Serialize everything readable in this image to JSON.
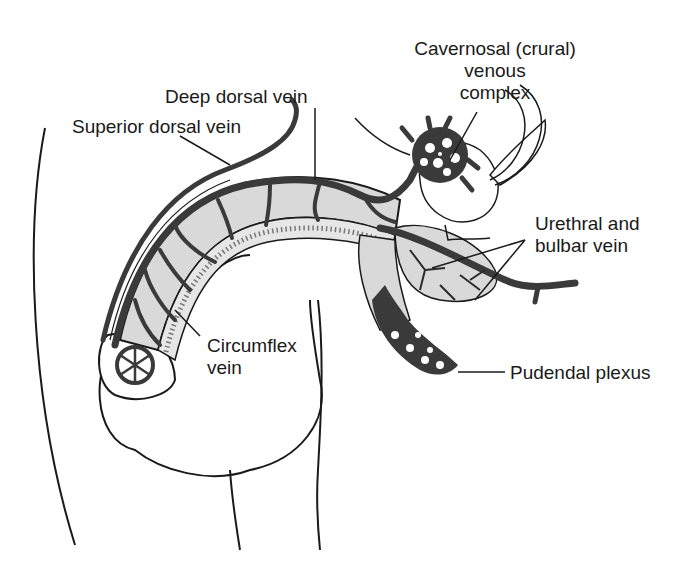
{
  "diagram": {
    "colors": {
      "background": "#ffffff",
      "line": "#1a1a1a",
      "vein_fill": "#3a3a3a",
      "tissue_fill": "#d9d9d9"
    },
    "labels": {
      "cavernosal": {
        "line1": "Cavernosal (crural)",
        "line2": "venous",
        "line3": "complex"
      },
      "deep_dorsal_vein": "Deep dorsal vein",
      "superior_dorsal_vein": "Superior dorsal vein",
      "urethral_bulbar": {
        "line1": "Urethral and",
        "line2": "bulbar vein"
      },
      "circumflex": {
        "line1": "Circumflex",
        "line2": "vein"
      },
      "pudendal_plexus": "Pudendal plexus"
    }
  }
}
